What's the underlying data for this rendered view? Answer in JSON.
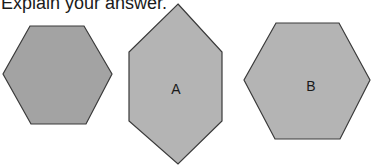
{
  "prompt": {
    "text": "Explain your answer."
  },
  "shapes": [
    {
      "name": "reference-hexagon",
      "label": "",
      "fill": "#a3a3a3",
      "points": "30,26 84,26 112,74 86,124 31,124 3,74"
    },
    {
      "name": "hexagon-a",
      "label": "A",
      "fill": "#b4b4b4",
      "points": "178,4 222,52 222,121 178,164 129,121 129,52",
      "label_x": 176,
      "label_y": 94
    },
    {
      "name": "hexagon-b",
      "label": "B",
      "fill": "#b4b4b4",
      "points": "276,23 339,23 370,80 340,139 275,139 244,80",
      "label_x": 311,
      "label_y": 91
    }
  ],
  "colors": {
    "stroke": "#3a3a3a",
    "text": "#1a1a1a"
  }
}
